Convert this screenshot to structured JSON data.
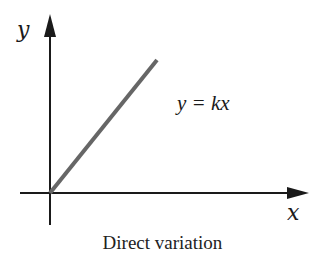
{
  "diagram": {
    "title": "Direct variation",
    "axes": {
      "x_label": "x",
      "y_label": "y"
    },
    "equation": "y = kx",
    "line": {
      "description": "straight line through origin with positive slope",
      "color": "#666666"
    },
    "axis_color": "#1a1a1a"
  }
}
